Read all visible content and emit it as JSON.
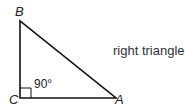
{
  "diagram": {
    "title": "right triangle",
    "vertices": {
      "A": {
        "label": "A",
        "x": 116,
        "y": 98
      },
      "B": {
        "label": "B",
        "x": 20,
        "y": 21
      },
      "C": {
        "label": "C",
        "x": 20,
        "y": 98
      }
    },
    "right_angle": {
      "vertex": "C",
      "label": "90°"
    },
    "colors": {
      "stroke": "#111111",
      "text": "#222222"
    }
  }
}
